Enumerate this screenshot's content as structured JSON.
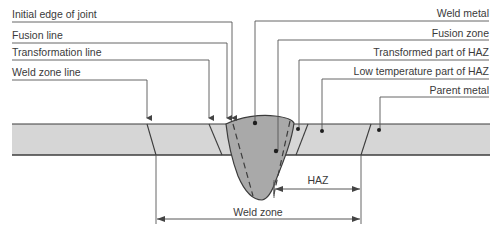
{
  "diagram": {
    "colors": {
      "plate_fill": "#d6d6d6",
      "weld_fill": "#a9a9a9",
      "line": "#3c3c3c",
      "leader": "#555555",
      "text": "#3a3a3a"
    },
    "left_labels": [
      {
        "text": "Initial edge of joint"
      },
      {
        "text": "Fusion line"
      },
      {
        "text": "Transformation line"
      },
      {
        "text": "Weld zone line"
      }
    ],
    "right_labels": [
      {
        "text": "Weld metal"
      },
      {
        "text": "Fusion zone"
      },
      {
        "text": "Transformed part of HAZ"
      },
      {
        "text": "Low temperature part of HAZ"
      },
      {
        "text": "Parent metal"
      }
    ],
    "dimensions": {
      "haz": "HAZ",
      "weld_zone": "Weld zone"
    }
  }
}
